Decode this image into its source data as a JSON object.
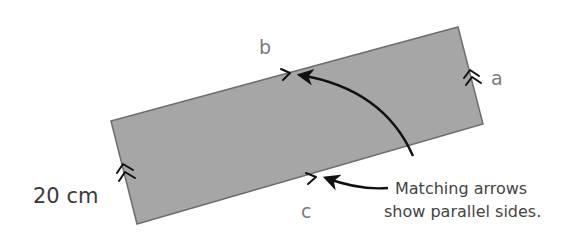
{
  "diagram": {
    "type": "parallelogram-parallel-sides",
    "shape": {
      "fill": "#a6a6a6",
      "stroke": "#6e6e6e",
      "vertices": {
        "top_left": [
          111,
          121
        ],
        "top_right": [
          458,
          27
        ],
        "bottom_right": [
          483,
          124
        ],
        "bottom_left": [
          137,
          224
        ]
      }
    },
    "labels": {
      "side_a": "a",
      "side_b": "b",
      "side_c": "c",
      "dimension": "20 cm"
    },
    "annotation": {
      "line1": "Matching arrows",
      "line2": "show parallel sides."
    },
    "markers": {
      "top_side": "single-arrow",
      "bottom_side": "single-arrow",
      "left_side": "double-arrow",
      "right_side": "double-arrow"
    },
    "colors": {
      "background": "#ffffff",
      "arrow": "#111111",
      "side_label": "#7a7a7a",
      "dimension_label": "#3a3a3a",
      "note_text": "#444444"
    }
  }
}
